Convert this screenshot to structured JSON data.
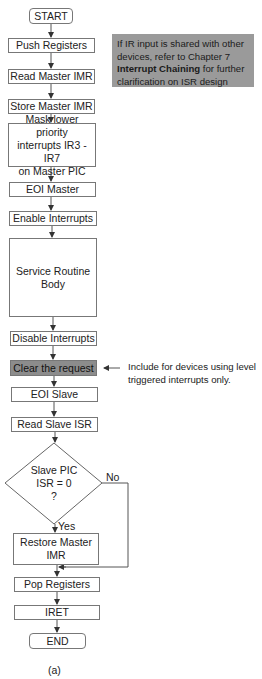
{
  "flowchart": {
    "nodes": [
      {
        "id": "start",
        "label": "START",
        "shape": "terminal"
      },
      {
        "id": "push_registers",
        "label": "Push Registers",
        "shape": "process"
      },
      {
        "id": "read_master_imr",
        "label": "Read Master IMR",
        "shape": "process"
      },
      {
        "id": "store_master_imr",
        "label": "Store Master IMR",
        "shape": "process"
      },
      {
        "id": "mask_lower_priority",
        "label": "Mask lower priority\ninterrupts IR3 - IR7\non Master PIC",
        "shape": "process"
      },
      {
        "id": "eoi_master",
        "label": "EOI Master",
        "shape": "process"
      },
      {
        "id": "enable_interrupts",
        "label": "Enable Interrupts",
        "shape": "process"
      },
      {
        "id": "service_routine_body",
        "label": "Service Routine\nBody",
        "shape": "process"
      },
      {
        "id": "disable_interrupts",
        "label": "Disable Interrupts",
        "shape": "process"
      },
      {
        "id": "clear_request",
        "label": "Clear the request",
        "shape": "process",
        "shaded": true
      },
      {
        "id": "eoi_slave",
        "label": "EOI Slave",
        "shape": "process"
      },
      {
        "id": "read_slave_isr",
        "label": "Read Slave ISR",
        "shape": "process"
      },
      {
        "id": "slave_pic_decision",
        "label": "Slave PIC\nISR = 0\n?",
        "shape": "decision"
      },
      {
        "id": "restore_master_imr",
        "label": "Restore Master\nIMR",
        "shape": "process"
      },
      {
        "id": "pop_registers",
        "label": "Pop Registers",
        "shape": "process"
      },
      {
        "id": "iret",
        "label": "IRET",
        "shape": "process"
      },
      {
        "id": "end",
        "label": "END",
        "shape": "terminal"
      }
    ],
    "edges": [
      {
        "from": "slave_pic_decision",
        "to": "restore_master_imr",
        "label": "Yes"
      },
      {
        "from": "slave_pic_decision",
        "to": "pop_registers",
        "label": "No"
      }
    ],
    "note_box": {
      "line1": "If IR input is shared with other",
      "line2": "devices, refer to Chapter 7",
      "bold": "Interrupt Chaining",
      "line3_rest": " for further",
      "line4": "clarification on ISR design"
    },
    "side_note": {
      "line1": "Include for devices using level",
      "line2": "triggered interrupts only."
    },
    "caption": "(a)"
  },
  "colors": {
    "note_bg": "#9a9a9a",
    "shaded_box": "#8c8c8c",
    "line": "#555555"
  }
}
